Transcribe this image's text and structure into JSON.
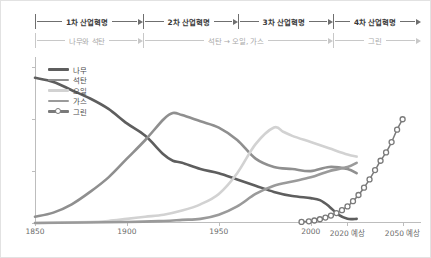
{
  "eras": {
    "row_top": [
      {
        "label": "1차 산업혁명"
      },
      {
        "label": "2차 산업혁명"
      },
      {
        "label": "3차 산업혁명"
      },
      {
        "label": "4차 산업혁명"
      }
    ],
    "row_bottom": [
      {
        "label": "나무와 석탄"
      },
      {
        "label": "석탄 → 오일, 가스"
      },
      {
        "label": ""
      },
      {
        "label": "그린"
      }
    ]
  },
  "chart_data": {
    "type": "line",
    "title": "",
    "xlabel": "",
    "ylabel": "",
    "xlim": [
      1850,
      2060
    ],
    "ylim": [
      0,
      80
    ],
    "xticks": [
      1850,
      1900,
      1950,
      2000,
      2020,
      2050
    ],
    "xtick_labels": [
      "1850",
      "1900",
      "1950",
      "2000",
      "2020 예상",
      "2050 예상"
    ],
    "yticks": [
      0,
      25,
      50,
      75
    ],
    "ytick_labels": [
      "0",
      "25",
      "50",
      "75"
    ],
    "grid": false,
    "legend_position": "top-left",
    "series": [
      {
        "name": "나무",
        "color": "#5e5e5e",
        "marker": false,
        "x": [
          1850,
          1860,
          1870,
          1880,
          1890,
          1900,
          1910,
          1920,
          1925,
          1930,
          1940,
          1950,
          1960,
          1970,
          1980,
          1990,
          2000,
          2005,
          2010,
          2015,
          2020,
          2025
        ],
        "values": [
          70,
          68,
          64,
          60,
          55,
          48,
          42,
          33,
          30,
          29,
          26,
          24,
          21,
          18,
          15,
          13,
          12,
          11,
          8,
          4,
          2,
          2
        ]
      },
      {
        "name": "석탄",
        "color": "#8f8f8f",
        "marker": false,
        "x": [
          1850,
          1860,
          1870,
          1880,
          1890,
          1900,
          1910,
          1920,
          1925,
          1930,
          1940,
          1950,
          1960,
          1970,
          1980,
          1990,
          2000,
          2010,
          2020,
          2025
        ],
        "values": [
          3,
          5,
          9,
          15,
          22,
          31,
          40,
          50,
          53,
          52,
          49,
          46,
          40,
          31,
          27,
          26,
          25,
          27,
          26,
          24
        ]
      },
      {
        "name": "오일",
        "color": "#d2d2d2",
        "marker": false,
        "x": [
          1850,
          1880,
          1890,
          1900,
          1910,
          1920,
          1930,
          1940,
          1950,
          1960,
          1970,
          1980,
          1985,
          1990,
          2000,
          2010,
          2020,
          2025
        ],
        "values": [
          0,
          0.5,
          1,
          2,
          3,
          4,
          6,
          9,
          14,
          24,
          38,
          46,
          44,
          42,
          39,
          36,
          33,
          32
        ]
      },
      {
        "name": "가스",
        "color": "#9a9a9a",
        "marker": false,
        "x": [
          1850,
          1900,
          1920,
          1930,
          1940,
          1950,
          1960,
          1970,
          1980,
          1990,
          2000,
          2010,
          2020,
          2025
        ],
        "values": [
          0,
          0.5,
          1,
          1.5,
          2,
          4,
          8,
          14,
          18,
          20,
          22,
          25,
          27,
          29
        ]
      },
      {
        "name": "그린",
        "color": "#7a7a7a",
        "marker": true,
        "x": [
          1995,
          1999,
          2002,
          2005,
          2008,
          2011,
          2014,
          2017,
          2020,
          2023,
          2026,
          2029,
          2032,
          2035,
          2038,
          2041,
          2044,
          2047,
          2050
        ],
        "values": [
          0.5,
          0.8,
          1.2,
          1.8,
          2.6,
          3.6,
          4.8,
          6.2,
          8,
          10.5,
          13.5,
          17,
          21,
          25.5,
          30,
          34,
          39,
          45,
          50
        ]
      }
    ]
  }
}
